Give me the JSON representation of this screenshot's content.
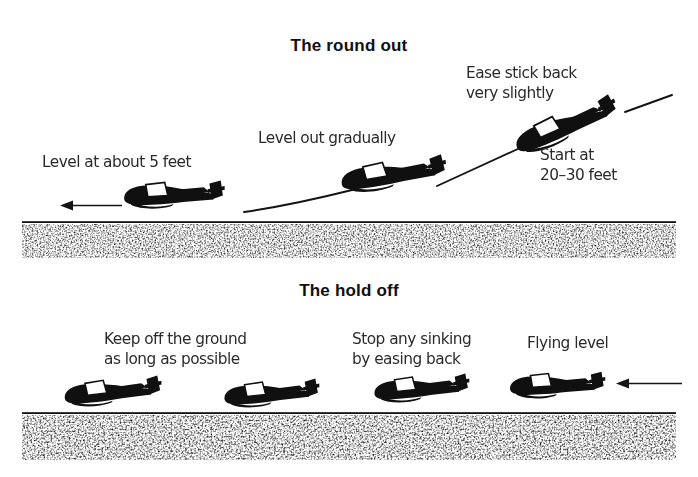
{
  "figure": {
    "title_alt": "Glider landing technique: the round out and the hold off",
    "ink_color": "#101010",
    "text_color": "#2a2a2a",
    "ground_color": "#111111",
    "background": "#ffffff"
  },
  "sections": [
    {
      "id": "round-out",
      "title": "The round out",
      "captions": [
        {
          "id": "level-at-about-5-feet",
          "text": "Level at about 5 feet"
        },
        {
          "id": "level-out-gradually",
          "text": "Level out gradually"
        },
        {
          "id": "ease-stick-back",
          "text": "Ease stick back\nvery slightly"
        },
        {
          "id": "start-at-20-30-feet",
          "text": "Start at\n20–30 feet"
        }
      ],
      "gliders": [
        {
          "id": "glider-low-level",
          "attitude": "level",
          "x": 165,
          "y": 198,
          "rotation": 0,
          "scale": 1.0
        },
        {
          "id": "glider-mid-levelling",
          "attitude": "slight-nose-up",
          "x": 385,
          "y": 185,
          "rotation": -6,
          "scale": 1.05
        },
        {
          "id": "glider-high-descending",
          "attitude": "nose-down-approach",
          "x": 560,
          "y": 123,
          "rotation": -22,
          "scale": 1.05
        }
      ],
      "arrows": [
        {
          "id": "direction-of-flight-arrow",
          "direction": "left",
          "x1": 120,
          "y1": 205,
          "x2": 62,
          "y2": 205
        }
      ]
    },
    {
      "id": "hold-off",
      "title": "The hold off",
      "captions": [
        {
          "id": "keep-off-the-ground",
          "text": "Keep off the ground\nas long as possible"
        },
        {
          "id": "stop-any-sinking",
          "text": "Stop any sinking\nby easing back"
        },
        {
          "id": "flying-level",
          "text": "Flying level"
        }
      ],
      "gliders": [
        {
          "id": "glider-holdoff-1",
          "attitude": "nose-high-hold-off",
          "x": 130,
          "y": 396,
          "rotation": -4,
          "scale": 1.0
        },
        {
          "id": "glider-holdoff-2",
          "attitude": "slight-nose-up",
          "x": 285,
          "y": 393,
          "rotation": -3,
          "scale": 1.0
        },
        {
          "id": "glider-holdoff-3",
          "attitude": "slight-nose-up",
          "x": 430,
          "y": 390,
          "rotation": -2,
          "scale": 1.0
        },
        {
          "id": "glider-holdoff-4",
          "attitude": "level",
          "x": 575,
          "y": 386,
          "rotation": 0,
          "scale": 1.0
        }
      ],
      "arrows": [
        {
          "id": "approach-direction-arrow",
          "direction": "left",
          "x1": 681,
          "y1": 383,
          "x2": 617,
          "y2": 383
        }
      ]
    }
  ],
  "ground_bands": [
    {
      "id": "ground-band-round-out",
      "line_y": 222,
      "band_top": 224,
      "band_height": 34
    },
    {
      "id": "ground-band-hold-off",
      "line_y": 413,
      "band_top": 415,
      "band_height": 45
    }
  ],
  "flight_paths": [
    {
      "id": "path-round-out-lower",
      "description": "curve from low glider to middle glider"
    },
    {
      "id": "path-round-out-upper",
      "description": "straight descent line from high glider down to middle glider"
    },
    {
      "id": "path-round-out-top",
      "description": "short descent line above and right of the high glider"
    }
  ]
}
